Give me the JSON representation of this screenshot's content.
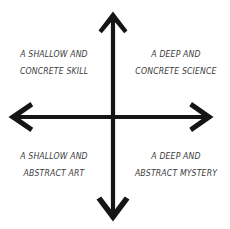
{
  "diagram": {
    "background_color": "#ffffff",
    "axis_color": "#151515",
    "text_color": "#3c3c3c",
    "axes": {
      "vertical": {
        "name": "vertical-axis",
        "top_arrowhead": true,
        "bottom_arrowhead": true,
        "label": ""
      },
      "horizontal": {
        "name": "horizontal-axis",
        "left_arrowhead": true,
        "right_arrowhead": true,
        "label": ""
      }
    },
    "quadrants": [
      {
        "position": "top-left",
        "line1": "A SHALLOW AND",
        "line2": "CONCRETE SKILL"
      },
      {
        "position": "top-right",
        "line1": "A DEEP AND",
        "line2": "CONCRETE SCIENCE"
      },
      {
        "position": "bottom-left",
        "line1": "A SHALLOW AND",
        "line2": "ABSTRACT ART"
      },
      {
        "position": "bottom-right",
        "line1": "A DEEP AND",
        "line2": "ABSTRACT MYSTERY"
      }
    ]
  }
}
